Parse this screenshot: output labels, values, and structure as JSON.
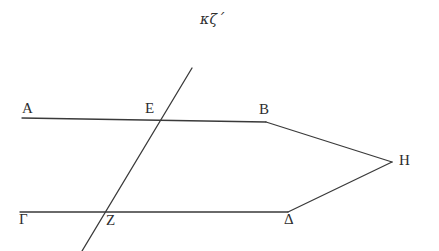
{
  "figure": {
    "title_note": "κζ΄",
    "note_description": "handwritten-greek-numeral-27",
    "background_color": "#ffffff",
    "stroke_color": "#3a3a3a",
    "label_color": "#2e2e2e",
    "stroke_width": 1.3,
    "canvas": {
      "width": 439,
      "height": 251
    }
  },
  "labels": [
    {
      "id": "A",
      "text": "A",
      "x": 22,
      "y": 101
    },
    {
      "id": "E",
      "text": "E",
      "x": 145,
      "y": 101
    },
    {
      "id": "B",
      "text": "B",
      "x": 259,
      "y": 102
    },
    {
      "id": "H",
      "text": "H",
      "x": 399,
      "y": 153
    },
    {
      "id": "G",
      "text": "Γ",
      "x": 19,
      "y": 212
    },
    {
      "id": "Z",
      "text": "Z",
      "x": 106,
      "y": 213
    },
    {
      "id": "D",
      "text": "Δ",
      "x": 284,
      "y": 212
    }
  ],
  "segments": [
    {
      "id": "line-AB",
      "name": "top-horizontal-line",
      "x1": 22,
      "y1": 118,
      "x2": 266,
      "y2": 122
    },
    {
      "id": "line-GD",
      "name": "bottom-horizontal-line",
      "x1": 20,
      "y1": 212,
      "x2": 288,
      "y2": 212
    },
    {
      "id": "line-transversal",
      "name": "transversal-line",
      "x1": 192,
      "y1": 68,
      "x2": 82,
      "y2": 251
    },
    {
      "id": "line-BH",
      "name": "upper-converging-segment",
      "x1": 266,
      "y1": 122,
      "x2": 392,
      "y2": 162
    },
    {
      "id": "line-DH",
      "name": "lower-converging-segment",
      "x1": 288,
      "y1": 212,
      "x2": 392,
      "y2": 162
    }
  ],
  "vertices": {
    "A": {
      "x": 22,
      "y": 118
    },
    "E": {
      "x": 162,
      "y": 118
    },
    "B": {
      "x": 266,
      "y": 122
    },
    "H": {
      "x": 392,
      "y": 162
    },
    "G": {
      "x": 20,
      "y": 212
    },
    "Z": {
      "x": 104,
      "y": 212
    },
    "D": {
      "x": 288,
      "y": 212
    }
  },
  "note_position": {
    "x": 200,
    "y": 12
  }
}
